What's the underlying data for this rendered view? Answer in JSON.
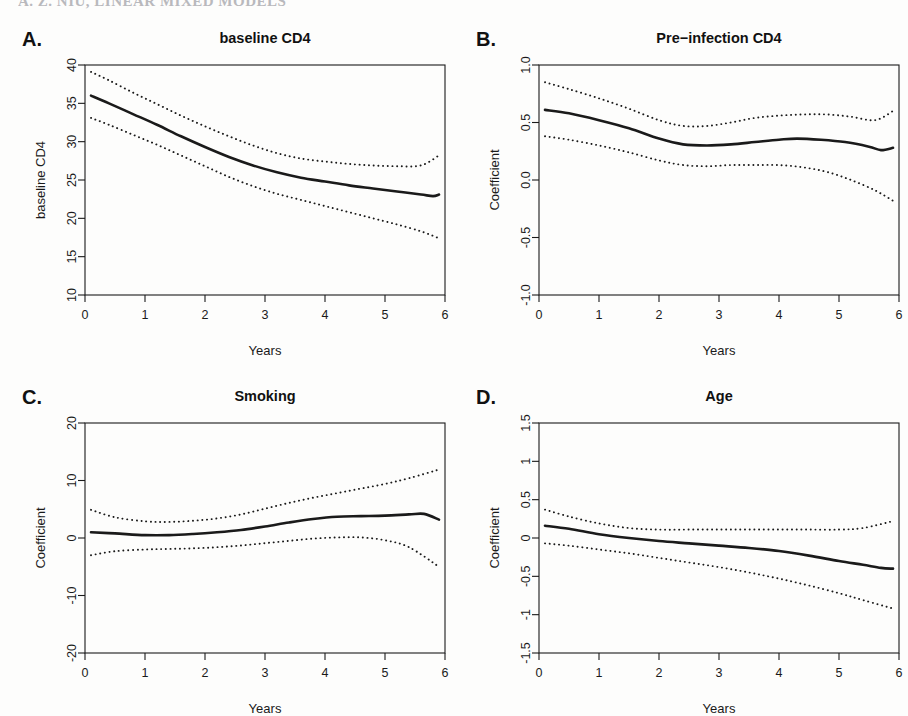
{
  "page": {
    "header_fragment": "A. Z. NIU, LINEAR MIXED MODELS",
    "background_color": "#fdfdfc",
    "ink_color": "#1a1a1a"
  },
  "figure": {
    "layout": "2x2",
    "panel_letters": [
      "A.",
      "B.",
      "C.",
      "D."
    ]
  },
  "chart_data": [
    {
      "panel": "A.",
      "type": "line",
      "title": "baseline CD4",
      "xlabel": "Years",
      "ylabel": "baseline CD4",
      "xlim": [
        0,
        6
      ],
      "ylim": [
        10,
        40
      ],
      "xticks": [
        0,
        1,
        2,
        3,
        4,
        5,
        6
      ],
      "xtick_labels": [
        "0",
        "1",
        "2",
        "3",
        "4",
        "5",
        "6"
      ],
      "yticks": [
        10,
        15,
        20,
        25,
        30,
        35,
        40
      ],
      "ytick_labels": [
        "10",
        "15",
        "20",
        "25",
        "30",
        "35",
        "40"
      ],
      "grid": false,
      "legend": "none",
      "series": [
        {
          "name": "estimate",
          "style": "solid",
          "x": [
            0.1,
            0.4,
            0.8,
            1.2,
            1.6,
            2.0,
            2.4,
            2.8,
            3.2,
            3.6,
            4.0,
            4.4,
            4.8,
            5.2,
            5.6,
            5.8,
            5.9
          ],
          "values": [
            36.0,
            35.0,
            33.6,
            32.2,
            30.7,
            29.3,
            28.0,
            26.9,
            26.0,
            25.3,
            24.8,
            24.3,
            23.9,
            23.5,
            23.1,
            22.9,
            23.1
          ]
        },
        {
          "name": "upper confidence band",
          "style": "dotted",
          "x": [
            0.1,
            0.4,
            0.8,
            1.2,
            1.6,
            2.0,
            2.4,
            2.8,
            3.2,
            3.6,
            4.0,
            4.4,
            4.8,
            5.2,
            5.6,
            5.9
          ],
          "values": [
            39.1,
            38.0,
            36.4,
            34.9,
            33.4,
            32.0,
            30.7,
            29.5,
            28.5,
            27.8,
            27.4,
            27.1,
            26.9,
            26.8,
            26.9,
            28.2
          ]
        },
        {
          "name": "lower confidence band",
          "style": "dotted",
          "x": [
            0.1,
            0.4,
            0.8,
            1.2,
            1.6,
            2.0,
            2.4,
            2.8,
            3.2,
            3.6,
            4.0,
            4.4,
            4.8,
            5.2,
            5.6,
            5.9
          ],
          "values": [
            33.1,
            32.2,
            30.9,
            29.6,
            28.2,
            26.8,
            25.4,
            24.2,
            23.2,
            22.4,
            21.6,
            20.8,
            20.0,
            19.2,
            18.3,
            17.4
          ]
        }
      ]
    },
    {
      "panel": "B.",
      "type": "line",
      "title": "Pre−infection CD4",
      "xlabel": "Years",
      "ylabel": "Coefficient",
      "xlim": [
        0,
        6
      ],
      "ylim": [
        -1.0,
        1.0
      ],
      "xticks": [
        0,
        1,
        2,
        3,
        4,
        5,
        6
      ],
      "xtick_labels": [
        "0",
        "1",
        "2",
        "3",
        "4",
        "5",
        "6"
      ],
      "yticks": [
        -1.0,
        -0.5,
        0.0,
        0.5,
        1.0
      ],
      "ytick_labels": [
        "-1.0",
        "-0.5",
        "0.0",
        "0.5",
        "1.0"
      ],
      "grid": false,
      "legend": "none",
      "series": [
        {
          "name": "estimate",
          "style": "solid",
          "x": [
            0.1,
            0.5,
            1.0,
            1.5,
            2.0,
            2.4,
            2.8,
            3.2,
            3.6,
            4.0,
            4.3,
            4.7,
            5.1,
            5.5,
            5.7,
            5.9
          ],
          "values": [
            0.61,
            0.58,
            0.52,
            0.45,
            0.36,
            0.31,
            0.3,
            0.31,
            0.33,
            0.35,
            0.36,
            0.35,
            0.33,
            0.29,
            0.26,
            0.28
          ]
        },
        {
          "name": "upper confidence band",
          "style": "dotted",
          "x": [
            0.1,
            0.5,
            1.0,
            1.5,
            2.0,
            2.4,
            2.8,
            3.2,
            3.6,
            4.0,
            4.4,
            4.8,
            5.2,
            5.6,
            5.9
          ],
          "values": [
            0.85,
            0.79,
            0.71,
            0.62,
            0.52,
            0.47,
            0.47,
            0.5,
            0.54,
            0.56,
            0.57,
            0.57,
            0.55,
            0.52,
            0.6
          ]
        },
        {
          "name": "lower confidence band",
          "style": "dotted",
          "x": [
            0.1,
            0.5,
            1.0,
            1.5,
            2.0,
            2.4,
            2.8,
            3.2,
            3.6,
            4.0,
            4.4,
            4.8,
            5.2,
            5.6,
            5.9
          ],
          "values": [
            0.38,
            0.35,
            0.3,
            0.24,
            0.17,
            0.13,
            0.12,
            0.13,
            0.13,
            0.13,
            0.11,
            0.07,
            0.0,
            -0.09,
            -0.18
          ]
        }
      ]
    },
    {
      "panel": "C.",
      "type": "line",
      "title": "Smoking",
      "xlabel": "Years",
      "ylabel": "Coefficient",
      "xlim": [
        0,
        6
      ],
      "ylim": [
        -20,
        20
      ],
      "xticks": [
        0,
        1,
        2,
        3,
        4,
        5,
        6
      ],
      "xtick_labels": [
        "0",
        "1",
        "2",
        "3",
        "4",
        "5",
        "6"
      ],
      "yticks": [
        -20,
        -10,
        0,
        10,
        20
      ],
      "ytick_labels": [
        "-20",
        "-10",
        "0",
        "10",
        "20"
      ],
      "grid": false,
      "legend": "none",
      "series": [
        {
          "name": "estimate",
          "style": "solid",
          "x": [
            0.1,
            0.5,
            1.0,
            1.4,
            1.8,
            2.2,
            2.6,
            3.0,
            3.4,
            3.8,
            4.2,
            4.6,
            5.0,
            5.4,
            5.65,
            5.9
          ],
          "values": [
            1.0,
            0.8,
            0.5,
            0.5,
            0.7,
            1.0,
            1.4,
            2.0,
            2.7,
            3.3,
            3.7,
            3.8,
            3.9,
            4.1,
            4.2,
            3.2
          ]
        },
        {
          "name": "upper confidence band",
          "style": "dotted",
          "x": [
            0.1,
            0.5,
            1.0,
            1.4,
            1.8,
            2.2,
            2.6,
            3.0,
            3.4,
            3.8,
            4.2,
            4.6,
            5.0,
            5.4,
            5.9
          ],
          "values": [
            4.9,
            3.6,
            2.9,
            2.8,
            3.0,
            3.4,
            4.1,
            5.1,
            6.1,
            7.0,
            7.8,
            8.6,
            9.4,
            10.4,
            11.9
          ]
        },
        {
          "name": "lower confidence band",
          "style": "dotted",
          "x": [
            0.1,
            0.5,
            1.0,
            1.4,
            1.8,
            2.2,
            2.6,
            3.0,
            3.4,
            3.8,
            4.2,
            4.6,
            5.0,
            5.4,
            5.9
          ],
          "values": [
            -3.0,
            -2.3,
            -2.0,
            -1.9,
            -1.8,
            -1.6,
            -1.3,
            -0.9,
            -0.5,
            -0.1,
            0.1,
            0.1,
            -0.4,
            -1.6,
            -5.0
          ]
        }
      ]
    },
    {
      "panel": "D.",
      "type": "line",
      "title": "Age",
      "xlabel": "Years",
      "ylabel": "Coefficient",
      "xlim": [
        0,
        6
      ],
      "ylim": [
        -1.5,
        1.5
      ],
      "xticks": [
        0,
        1,
        2,
        3,
        4,
        5,
        6
      ],
      "xtick_labels": [
        "0",
        "1",
        "2",
        "3",
        "4",
        "5",
        "6"
      ],
      "yticks": [
        -1.5,
        -1,
        -0.5,
        0,
        0.5,
        1,
        1.5
      ],
      "ytick_labels": [
        "-1.5",
        "-1",
        "-0.5",
        "0",
        "0.5",
        "1",
        "1.5"
      ],
      "grid": false,
      "legend": "none",
      "series": [
        {
          "name": "estimate",
          "style": "solid",
          "x": [
            0.1,
            0.5,
            1.0,
            1.5,
            2.0,
            2.5,
            3.0,
            3.5,
            4.0,
            4.5,
            5.0,
            5.4,
            5.7,
            5.9
          ],
          "values": [
            0.16,
            0.12,
            0.05,
            0.0,
            -0.04,
            -0.07,
            -0.1,
            -0.13,
            -0.17,
            -0.23,
            -0.3,
            -0.35,
            -0.39,
            -0.4
          ]
        },
        {
          "name": "upper confidence band",
          "style": "dotted",
          "x": [
            0.1,
            0.5,
            1.0,
            1.5,
            2.0,
            2.5,
            3.0,
            3.5,
            4.0,
            4.5,
            5.0,
            5.4,
            5.9
          ],
          "values": [
            0.37,
            0.28,
            0.19,
            0.13,
            0.11,
            0.11,
            0.11,
            0.11,
            0.11,
            0.11,
            0.11,
            0.13,
            0.22
          ]
        },
        {
          "name": "lower confidence band",
          "style": "dotted",
          "x": [
            0.1,
            0.5,
            1.0,
            1.5,
            2.0,
            2.5,
            3.0,
            3.5,
            4.0,
            4.5,
            5.0,
            5.4,
            5.9
          ],
          "values": [
            -0.07,
            -0.1,
            -0.15,
            -0.2,
            -0.26,
            -0.32,
            -0.38,
            -0.45,
            -0.53,
            -0.62,
            -0.72,
            -0.81,
            -0.92
          ]
        }
      ]
    }
  ]
}
